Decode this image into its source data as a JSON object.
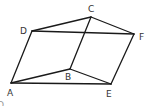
{
  "diagram": {
    "type": "geometry-figure",
    "points": {
      "A": {
        "x": 11,
        "y": 83,
        "label": "A",
        "lx": 7,
        "ly": 96
      },
      "B": {
        "x": 70,
        "y": 69,
        "label": "B",
        "lx": 65,
        "ly": 80
      },
      "C": {
        "x": 91,
        "y": 17,
        "label": "C",
        "lx": 88,
        "ly": 12
      },
      "D": {
        "x": 32,
        "y": 31,
        "label": "D",
        "lx": 20,
        "ly": 34
      },
      "E": {
        "x": 111,
        "y": 84,
        "label": "E",
        "lx": 106,
        "ly": 97
      },
      "F": {
        "x": 134,
        "y": 34,
        "label": "F",
        "lx": 139,
        "ly": 40
      }
    },
    "edges": [
      [
        "A",
        "D"
      ],
      [
        "D",
        "C"
      ],
      [
        "C",
        "F"
      ],
      [
        "D",
        "F"
      ],
      [
        "C",
        "B"
      ],
      [
        "A",
        "B"
      ],
      [
        "B",
        "E"
      ],
      [
        "A",
        "E"
      ],
      [
        "E",
        "F"
      ]
    ],
    "stray_mark": "O",
    "colors": {
      "line": "#1a1a1a",
      "label": "#333333",
      "background": "#ffffff"
    }
  }
}
